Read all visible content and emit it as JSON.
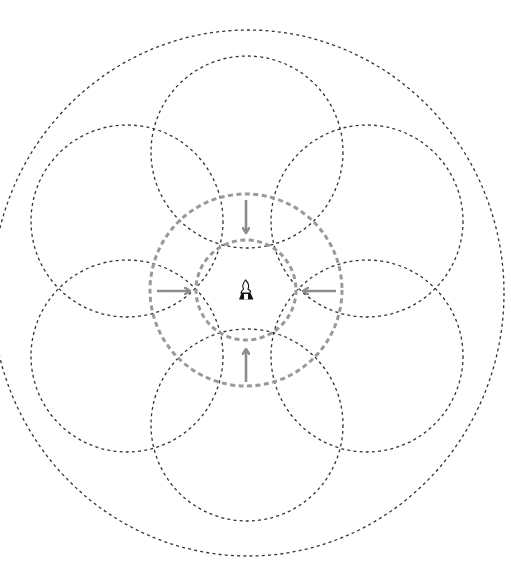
{
  "diagram": {
    "colors": {
      "background": "#ffffff",
      "black_dash": "#333333",
      "gray_dash": "#999999",
      "arrow": "#8c8c8c",
      "icon": "#111111"
    },
    "center": {
      "x": 247,
      "y": 289
    },
    "outer_ellipse": {
      "cx": 248,
      "cy": 293,
      "rx": 256,
      "ry": 263
    },
    "petal_circles": {
      "radius": 96,
      "items": [
        {
          "name": "top",
          "cx": 247,
          "cy": 152
        },
        {
          "name": "upper-right",
          "cx": 367,
          "cy": 221
        },
        {
          "name": "lower-right",
          "cx": 367,
          "cy": 356
        },
        {
          "name": "bottom",
          "cx": 247,
          "cy": 425
        },
        {
          "name": "lower-left",
          "cx": 127,
          "cy": 356
        },
        {
          "name": "upper-left",
          "cx": 127,
          "cy": 221
        }
      ]
    },
    "gray_circles": [
      {
        "name": "outer-ring",
        "cx": 246,
        "cy": 290,
        "r": 96
      },
      {
        "name": "inner-ring",
        "cx": 246,
        "cy": 290,
        "r": 50
      }
    ],
    "arrows": [
      {
        "name": "arrow-down-from-top",
        "direction": "down",
        "x1": 246,
        "y1": 200,
        "x2": 246,
        "y2": 233
      },
      {
        "name": "arrow-right-from-left",
        "direction": "right",
        "x1": 157,
        "y1": 291,
        "x2": 190,
        "y2": 291
      },
      {
        "name": "arrow-left-from-right",
        "direction": "left",
        "x1": 336,
        "y1": 291,
        "x2": 303,
        "y2": 291
      },
      {
        "name": "arrow-up-from-bottom",
        "direction": "up",
        "x1": 246,
        "y1": 382,
        "x2": 246,
        "y2": 349
      }
    ],
    "center_icon": {
      "name": "seated-figure-icon",
      "x": 237,
      "y": 279,
      "w": 17,
      "h": 21
    }
  }
}
